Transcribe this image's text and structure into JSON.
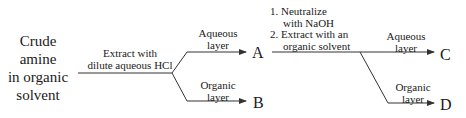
{
  "diagram": {
    "start_label": [
      "Crude",
      "amine",
      "in organic",
      "solvent"
    ],
    "step1_label": [
      "Extract with",
      "dilute aqueous HCl"
    ],
    "branch1_upper": [
      "Aqueous",
      "layer"
    ],
    "branch1_lower": [
      "Organic",
      "layer"
    ],
    "product_a": "A",
    "product_b": "B",
    "step2_steps": [
      "1. Neutralize",
      "with NaOH",
      "2. Extract with an",
      "organic solvent"
    ],
    "branch2_upper": [
      "Aqueous",
      "layer"
    ],
    "branch2_lower": [
      "Organic",
      "layer"
    ],
    "product_c": "C",
    "product_d": "D",
    "line_color": "#333333"
  }
}
